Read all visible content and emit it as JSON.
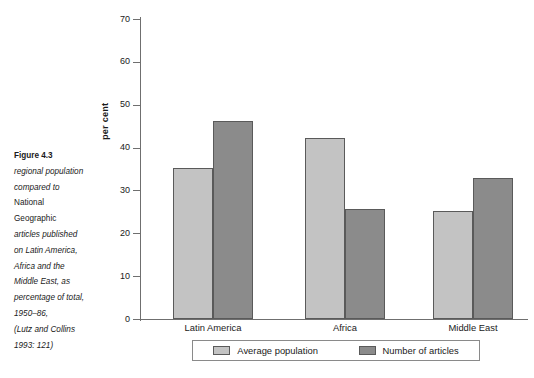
{
  "caption": {
    "figure_number": "Figure 4.3",
    "lines": [
      "regional population",
      "compared to",
      "National",
      "Geographic",
      "articles published",
      "on Latin America,",
      "Africa and the",
      "Middle East, as",
      "percentage of total,",
      "1950–86,",
      "(Lutz and Collins",
      "1993: 121)"
    ]
  },
  "colors": {
    "series_light": "#c3c3c3",
    "series_dark": "#8b8b8b",
    "axis": "#6f6f6f",
    "bar_border": "#5a5a5a",
    "text": "#1a1a1a"
  },
  "chart_data": {
    "type": "bar",
    "title": "",
    "subtitle": "",
    "xlabel": "",
    "ylabel": "per cent",
    "ylim": [
      0,
      70
    ],
    "yticks": [
      0,
      10,
      20,
      30,
      40,
      50,
      60,
      70
    ],
    "ytick_labels": [
      "0",
      "10",
      "20",
      "30",
      "40",
      "50",
      "60",
      "70"
    ],
    "grid": false,
    "legend_position": "bottom",
    "categories": [
      "Latin America",
      "Africa",
      "Middle East"
    ],
    "series": [
      {
        "name": "Average population",
        "color": "#c3c3c3",
        "values": [
          35.2,
          42.2,
          25.2
        ]
      },
      {
        "name": "Number of articles",
        "color": "#8b8b8b",
        "values": [
          46.3,
          25.7,
          33.0
        ]
      }
    ]
  }
}
